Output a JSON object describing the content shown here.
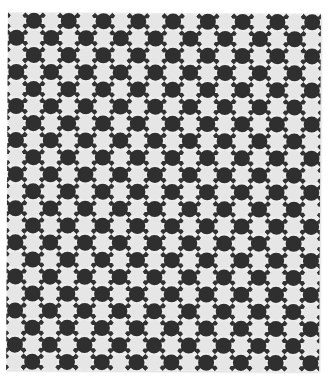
{
  "image": {
    "subject": "black and white photograph of a quilt with checkerboard circle pattern",
    "background_color": "#ffffff"
  },
  "quilt": {
    "columns": 18,
    "rows": 21,
    "first_circle": "light",
    "colors": {
      "dark": "#2f2f2f",
      "light": "#e6e6e6",
      "ground": "#ededed",
      "corner_triangle": "#333333"
    }
  }
}
